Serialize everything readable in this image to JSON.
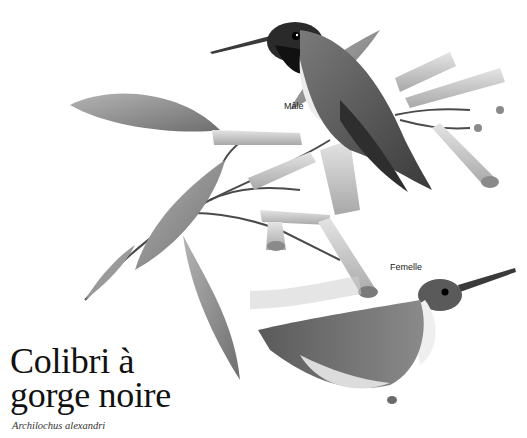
{
  "illustration": {
    "subject": "hummingbirds on flowering branch",
    "labels": {
      "male": "Mâle",
      "female": "Femelle"
    }
  },
  "species": {
    "common_name_line1": "Colibri à",
    "common_name_line2": "gorge noire",
    "scientific_name": "Archilochus alexandri"
  },
  "colors": {
    "background": "#ffffff",
    "title_text": "#111111",
    "gorget": "#141414",
    "plumage": "#6e6e6e",
    "leaf": "#8a8a8a",
    "flower": "#d0d0d0"
  }
}
